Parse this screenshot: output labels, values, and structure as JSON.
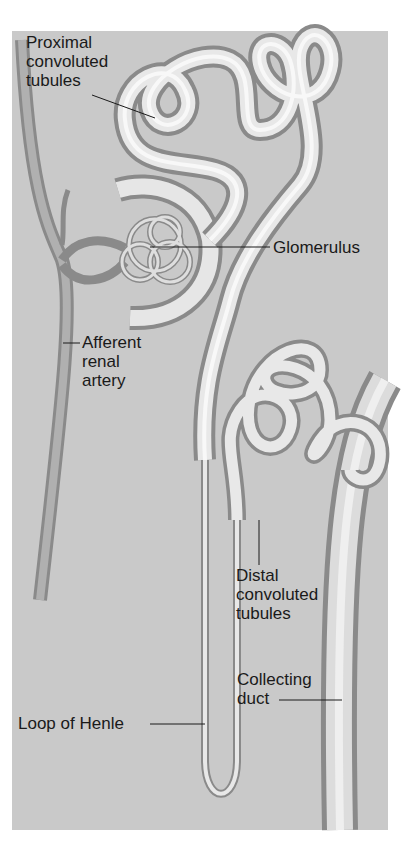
{
  "diagram": {
    "labels": {
      "proximal": "Proximal\nconvoluted\ntubules",
      "glomerulus": "Glomerulus",
      "afferent": "Afferent\nrenal\nartery",
      "distal": "Distal\nconvoluted\ntubules",
      "collecting": "Collecting\nduct",
      "loop": "Loop of Henle"
    },
    "colors": {
      "background": "#c9c9c9",
      "tube": "#e6e6e6",
      "tube_edge": "#8a8a8a",
      "vessel": "#9a9a9a",
      "leader": "#1a1a1a"
    }
  }
}
